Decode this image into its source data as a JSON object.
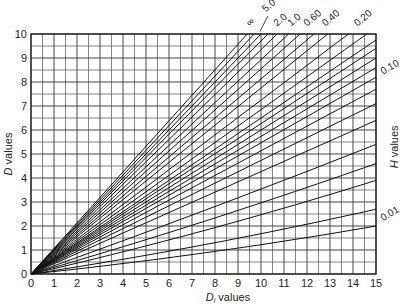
{
  "chart_data": {
    "type": "line",
    "title": "",
    "xlabel": "D_i values",
    "ylabel": "D values",
    "right_label": "H values",
    "xlim": [
      0,
      15
    ],
    "ylim": [
      0,
      10
    ],
    "x_ticks": [
      "0",
      "1",
      "2",
      "3",
      "4",
      "5",
      "6",
      "7",
      "8",
      "9",
      "10",
      "11",
      "12",
      "13",
      "14",
      "15"
    ],
    "y_ticks": [
      "0",
      "1",
      "2",
      "3",
      "4",
      "5",
      "6",
      "7",
      "8",
      "9",
      "10"
    ],
    "grid": true,
    "grid_step": 0.5,
    "curve_labels": [
      {
        "text": "∞",
        "x": 9.5,
        "y": 10.3
      },
      {
        "text": "5.0",
        "x": 10.2,
        "y": 10.9
      },
      {
        "text": "2.0",
        "x": 10.7,
        "y": 10.3
      },
      {
        "text": "1.0",
        "x": 11.3,
        "y": 10.3
      },
      {
        "text": "0.60",
        "x": 12.0,
        "y": 10.3
      },
      {
        "text": "0.40",
        "x": 12.8,
        "y": 10.3
      },
      {
        "text": "0.20",
        "x": 14.2,
        "y": 10.3
      },
      {
        "text": "0.10",
        "x": 15.3,
        "y": 8.3
      },
      {
        "text": "0.01",
        "x": 15.3,
        "y": 2.2
      }
    ],
    "series_endpoints": [
      {
        "x": 9.4,
        "y": 10
      },
      {
        "x": 9.7,
        "y": 10
      },
      {
        "x": 10.0,
        "y": 10
      },
      {
        "x": 10.3,
        "y": 10
      },
      {
        "x": 10.7,
        "y": 10
      },
      {
        "x": 11.2,
        "y": 10
      },
      {
        "x": 11.7,
        "y": 10
      },
      {
        "x": 12.3,
        "y": 10
      },
      {
        "x": 12.9,
        "y": 10
      },
      {
        "x": 13.8,
        "y": 10
      },
      {
        "x": 14.6,
        "y": 10
      },
      {
        "x": 15,
        "y": 9.75
      },
      {
        "x": 15,
        "y": 9.4
      },
      {
        "x": 15,
        "y": 9.0
      },
      {
        "x": 15,
        "y": 8.6
      },
      {
        "x": 15,
        "y": 8.2
      },
      {
        "x": 15,
        "y": 7.7
      },
      {
        "x": 15,
        "y": 7.1
      },
      {
        "x": 15,
        "y": 6.4
      },
      {
        "x": 15,
        "y": 5.4
      },
      {
        "x": 15,
        "y": 4.6
      },
      {
        "x": 15,
        "y": 3.9
      },
      {
        "x": 15,
        "y": 2.7
      },
      {
        "x": 15,
        "y": 2.0
      }
    ]
  }
}
